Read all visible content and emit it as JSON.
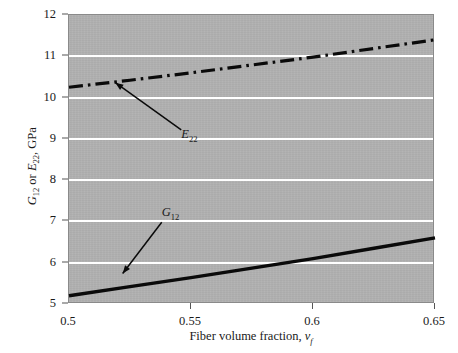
{
  "chart_data": {
    "type": "line",
    "title": "",
    "xlabel": "Fiber volume fraction, v_f",
    "ylabel": "G_12 or E_22, GPa",
    "xlim": [
      0.5,
      0.65
    ],
    "ylim": [
      5,
      12
    ],
    "xticks": [
      "0.5",
      "0.55",
      "0.6",
      "0.65"
    ],
    "xtick_values": [
      0.5,
      0.55,
      0.6,
      0.65
    ],
    "yticks": [
      "5",
      "6",
      "7",
      "8",
      "9",
      "10",
      "11",
      "12"
    ],
    "ytick_values": [
      5,
      6,
      7,
      8,
      9,
      10,
      11,
      12
    ],
    "grid": true,
    "grid_color": "#ffffff",
    "plot_background": "#b1b1b1",
    "legend": "none (inline annotations with arrows)",
    "series": [
      {
        "name": "E_22",
        "label": "E",
        "label_sub": "22",
        "style": "dash-dot",
        "color": "#000000",
        "x": [
          0.5,
          0.525,
          0.55,
          0.575,
          0.6,
          0.625,
          0.65
        ],
        "values": [
          10.25,
          10.42,
          10.6,
          10.79,
          10.98,
          11.19,
          11.4
        ]
      },
      {
        "name": "G_12",
        "label": "G",
        "label_sub": "12",
        "style": "solid",
        "color": "#000000",
        "x": [
          0.5,
          0.525,
          0.55,
          0.575,
          0.6,
          0.625,
          0.65
        ],
        "values": [
          5.2,
          5.42,
          5.64,
          5.87,
          6.1,
          6.35,
          6.6
        ]
      }
    ],
    "annotations": [
      {
        "text": "E",
        "sub": "22",
        "target_series": "E_22",
        "label_x": 0.546,
        "label_y": 9.22,
        "arrow_x": 0.519,
        "arrow_y": 10.36
      },
      {
        "text": "G",
        "sub": "12",
        "target_series": "G_12",
        "label_x": 0.538,
        "label_y": 6.98,
        "arrow_x": 0.522,
        "arrow_y": 5.74
      }
    ]
  },
  "axis": {
    "y_title_main": "G",
    "y_title_sub1": "12",
    "y_title_mid": " or ",
    "y_title_main2": "E",
    "y_title_sub2": "22",
    "y_title_unit": ", GPa",
    "x_title_main": "Fiber volume fraction, ",
    "x_title_var": "v",
    "x_title_sub": "f"
  }
}
